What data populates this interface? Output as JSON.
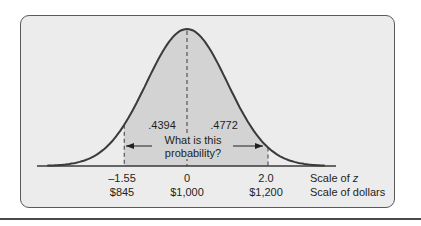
{
  "chart_data": {
    "type": "area",
    "title": "",
    "mean": 1000,
    "std_dev": 100,
    "z_axis": {
      "label": "Scale of z",
      "ticks": [
        -1.55,
        0,
        2.0
      ],
      "tick_labels": [
        "–1.55",
        "0",
        "2.0"
      ]
    },
    "dollar_axis": {
      "label": "Scale of dollars",
      "ticks": [
        845,
        1000,
        1200
      ],
      "tick_labels": [
        "$845",
        "$1,000",
        "$1,200"
      ]
    },
    "shaded_region": {
      "z_from": -1.55,
      "z_to": 2.0
    },
    "areas": [
      {
        "z_from": -1.55,
        "z_to": 0,
        "value": 0.4394,
        "label": ".4394"
      },
      {
        "z_from": 0,
        "z_to": 2.0,
        "value": 0.4772,
        "label": ".4772"
      }
    ],
    "annotation": {
      "line1": "What is this",
      "line2": "probability?"
    },
    "colors": {
      "panel": "#ececec",
      "shade": "#d3d3d3",
      "curve": "#3a3a3a",
      "border": "#5a5a5a"
    }
  },
  "labels": {
    "area_left": ".4394",
    "area_right": ".4772",
    "question_line1": "What is this",
    "question_line2": "probability?",
    "z_left": "–1.55",
    "z_mid": "0",
    "z_right": "2.0",
    "d_left": "$845",
    "d_mid": "$1,000",
    "d_right": "$1,200",
    "z_scale": "Scale of z",
    "d_scale": "Scale of dollars"
  }
}
